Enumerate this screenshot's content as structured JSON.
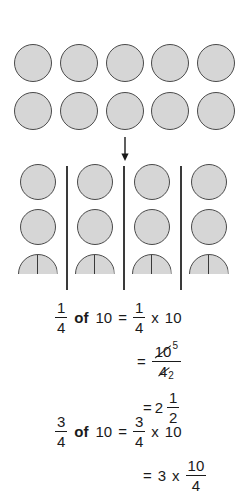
{
  "page": {
    "background_color": "#ffffff"
  },
  "diagram": {
    "circle_fill_color": "#d6d6d6",
    "circle_border_color": "#4a4a4a",
    "top_group": {
      "label": "ten-whole-circles",
      "rows": 2,
      "per_row": 5,
      "total": 10
    },
    "arrow": {
      "icon": "arrow-down-icon",
      "direction": "down"
    },
    "grouped_section": {
      "label": "ten-circles-split-into-four-equal-groups",
      "group_count": 4,
      "divider_count": 3,
      "per_group_whole": 2,
      "per_group_half": 1,
      "per_group_value": "2 1/2"
    }
  },
  "equations": {
    "line1": {
      "frac1_num": "1",
      "frac1_den": "4",
      "of": "of",
      "operand": "10",
      "equals": "=",
      "frac2_num": "1",
      "frac2_den": "4",
      "times": "x",
      "multiplicand": "10"
    },
    "line2": {
      "equals": "=",
      "num_base": "10",
      "num_reduced": "5",
      "den_base": "4",
      "den_reduced": "2"
    },
    "line3": {
      "equals": "=",
      "whole": "2",
      "frac_num": "1",
      "frac_den": "2"
    },
    "line4": {
      "frac1_num": "3",
      "frac1_den": "4",
      "of": "of",
      "operand": "10",
      "equals": "=",
      "frac2_num": "3",
      "frac2_den": "4",
      "times": "x",
      "multiplicand": "10"
    },
    "line5": {
      "equals": "=",
      "factor": "3",
      "times": "x",
      "frac_num": "10",
      "frac_den": "4"
    }
  }
}
